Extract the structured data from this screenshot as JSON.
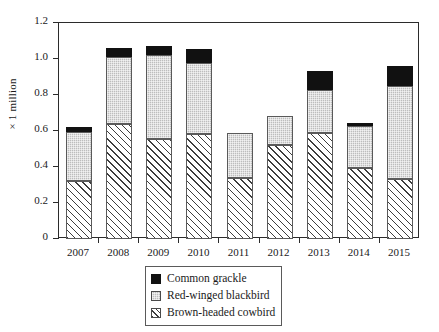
{
  "chart_data": {
    "type": "bar",
    "subtype": "stacked-vertical",
    "title": "",
    "xlabel": "",
    "ylabel": "× 1 million",
    "categories": [
      "2007",
      "2008",
      "2009",
      "2010",
      "2011",
      "2012",
      "2013",
      "2014",
      "2015"
    ],
    "ylim": [
      0,
      1.2
    ],
    "ytick_labels": [
      "0",
      "0.2",
      "0.4",
      "0.6",
      "0.8",
      "1.0",
      "1.2"
    ],
    "ytick_values": [
      0,
      0.2,
      0.4,
      0.6,
      0.8,
      1.0,
      1.2
    ],
    "grid": false,
    "legend_position": "bottom-center",
    "stack_order_bottom_to_top": [
      "Brown-headed cowbird",
      "Red-winged blackbird",
      "Common grackle"
    ],
    "series": [
      {
        "name": "Brown-headed cowbird",
        "fill": "diagonal-hatch",
        "color": "#ffffff",
        "values": [
          0.32,
          0.64,
          0.555,
          0.583,
          0.34,
          0.52,
          0.59,
          0.395,
          0.333
        ]
      },
      {
        "name": "Red-winged blackbird",
        "fill": "light-gray-dotted",
        "color": "#bdbdbd",
        "values": [
          0.275,
          0.37,
          0.465,
          0.395,
          0.25,
          0.165,
          0.24,
          0.235,
          0.517
        ]
      },
      {
        "name": "Common grackle",
        "fill": "solid-black",
        "color": "#111111",
        "values": [
          0.025,
          0.05,
          0.05,
          0.077,
          0.0,
          0.0,
          0.105,
          0.015,
          0.11
        ]
      }
    ],
    "totals": [
      0.62,
      1.06,
      1.07,
      1.055,
      0.59,
      0.685,
      0.935,
      0.645,
      0.96
    ]
  },
  "legend": {
    "items": [
      {
        "label": "Common grackle",
        "swatch": "solid-black-swatch"
      },
      {
        "label": "Red-winged blackbird",
        "swatch": "gray-dotted-swatch"
      },
      {
        "label": "Brown-headed cowbird",
        "swatch": "diagonal-hatch-swatch"
      }
    ]
  }
}
